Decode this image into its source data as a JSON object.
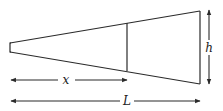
{
  "diagram": {
    "type": "tapered-beam-dimension-sketch",
    "labels": {
      "x": "x",
      "L": "L",
      "h": "h"
    },
    "colors": {
      "stroke": "#2a2a2a",
      "background": "#ffffff"
    }
  }
}
